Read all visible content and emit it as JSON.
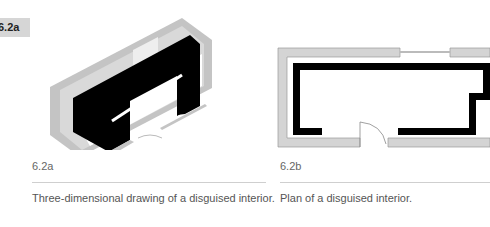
{
  "label": {
    "text": "6.2a",
    "background": "#d6d6d6"
  },
  "figures": [
    {
      "number": "6.2a",
      "caption": "Three-dimensional drawing of a disguised interior.",
      "type": "3d-drawing"
    },
    {
      "number": "6.2b",
      "caption": "Plan of a disguised interior.",
      "type": "plan"
    }
  ],
  "colors": {
    "wall": "#c6c6c6",
    "partition": "#000000",
    "rule": "#cfcfcf"
  }
}
